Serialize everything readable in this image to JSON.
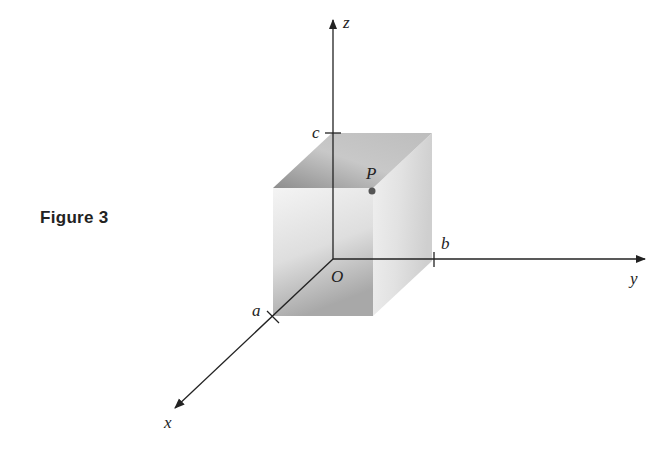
{
  "caption": "Figure 3",
  "axes": {
    "x": {
      "label": "x"
    },
    "y": {
      "label": "y"
    },
    "z": {
      "label": "z"
    }
  },
  "origin": {
    "label": "O"
  },
  "ticks": {
    "a": {
      "label": "a",
      "axis": "x"
    },
    "b": {
      "label": "b",
      "axis": "y"
    },
    "c": {
      "label": "c",
      "axis": "z"
    }
  },
  "point": {
    "label": "P",
    "description": "vertex of box opposite origin at (a, b, c)"
  },
  "colors": {
    "axis": "#222222",
    "box_light": "#f2f2f2",
    "box_dark": "#9a9a9a",
    "point": "#555555"
  }
}
